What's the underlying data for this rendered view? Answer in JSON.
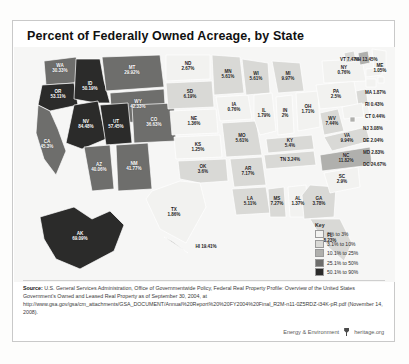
{
  "card": {
    "title": "Percent of Federally Owned Acreage, by State"
  },
  "legend": {
    "heading": "Key",
    "items": [
      {
        "label": "0% to 3%",
        "color": "#f2f2f0"
      },
      {
        "label": "3.1% to 10%",
        "color": "#d9d9d6"
      },
      {
        "label": "10.1% to 25%",
        "color": "#b0b0ad"
      },
      {
        "label": "25.1% to 50%",
        "color": "#6e6e6c"
      },
      {
        "label": "50.1% to 90%",
        "color": "#2b2b2a"
      }
    ]
  },
  "source": {
    "label": "Source:",
    "text": " U.S. General Services Administration, Office of Governmentwide Policy, Federal Real Property Profile: Overview of the United States Government's Owned and Leased Real Property as of September 30, 2004, at http://www.gsa.gov/gsa/cm_attachments/GSA_DOCUMENT/Annual%20Report%20%20FY2004%20Final_R2M-n11-0Z5RDZ-i34K-pR.pdf (November 14, 2008)."
  },
  "footer": {
    "series": "Energy & Environment",
    "brand": "heritage.org",
    "logo": "heritage-shield-icon"
  },
  "chart_data": {
    "type": "map",
    "title": "Percent of Federally Owned Acreage, by State",
    "unit": "percent",
    "legend_bins": [
      "0% to 3%",
      "3.1% to 10%",
      "10.1% to 25%",
      "25.1% to 50%",
      "50.1% to 90%"
    ],
    "bin_colors": [
      "#f2f2f0",
      "#d9d9d6",
      "#b0b0ad",
      "#6e6e6c",
      "#2b2b2a"
    ],
    "states": [
      {
        "ab": "WA",
        "value": "30.33%",
        "num": 30.33,
        "bin": 3
      },
      {
        "ab": "OR",
        "value": "53.11%",
        "num": 53.11,
        "bin": 4
      },
      {
        "ab": "ID",
        "value": "50.19%",
        "num": 50.19,
        "bin": 4
      },
      {
        "ab": "MT",
        "value": "29.92%",
        "num": 29.92,
        "bin": 3
      },
      {
        "ab": "WY",
        "value": "42.33%",
        "num": 42.33,
        "bin": 3
      },
      {
        "ab": "NV",
        "value": "84.48%",
        "num": 84.48,
        "bin": 4
      },
      {
        "ab": "UT",
        "value": "57.45%",
        "num": 57.45,
        "bin": 4
      },
      {
        "ab": "CO",
        "value": "36.63%",
        "num": 36.63,
        "bin": 3
      },
      {
        "ab": "CA",
        "value": "45.3%",
        "num": 45.3,
        "bin": 3
      },
      {
        "ab": "AZ",
        "value": "40.06%",
        "num": 40.06,
        "bin": 3
      },
      {
        "ab": "NM",
        "value": "41.77%",
        "num": 41.77,
        "bin": 3
      },
      {
        "ab": "ND",
        "value": "2.67%",
        "num": 2.67,
        "bin": 0
      },
      {
        "ab": "SD",
        "value": "6.19%",
        "num": 6.19,
        "bin": 1
      },
      {
        "ab": "NE",
        "value": "1.36%",
        "num": 1.36,
        "bin": 0
      },
      {
        "ab": "KS",
        "value": "1.25%",
        "num": 1.25,
        "bin": 0
      },
      {
        "ab": "MN",
        "value": "5.61%",
        "num": 5.61,
        "bin": 1
      },
      {
        "ab": "IA",
        "value": "0.76%",
        "num": 0.76,
        "bin": 0
      },
      {
        "ab": "MO",
        "value": "5.61%",
        "num": 5.61,
        "bin": 1
      },
      {
        "ab": "WI",
        "value": "5.61%",
        "num": 5.61,
        "bin": 1
      },
      {
        "ab": "IL",
        "value": "1.79%",
        "num": 1.79,
        "bin": 0
      },
      {
        "ab": "MI",
        "value": "9.97%",
        "num": 9.97,
        "bin": 1
      },
      {
        "ab": "IN",
        "value": "2%",
        "num": 2.0,
        "bin": 0
      },
      {
        "ab": "OH",
        "value": "1.71%",
        "num": 1.71,
        "bin": 0
      },
      {
        "ab": "KY",
        "value": "5.4%",
        "num": 5.4,
        "bin": 1
      },
      {
        "ab": "TN",
        "value": "3.24%",
        "num": 3.24,
        "bin": 1
      },
      {
        "ab": "OK",
        "value": "3.6%",
        "num": 3.6,
        "bin": 1
      },
      {
        "ab": "AR",
        "value": "7.17%",
        "num": 7.17,
        "bin": 1
      },
      {
        "ab": "TX",
        "value": "1.86%",
        "num": 1.86,
        "bin": 0
      },
      {
        "ab": "LA",
        "value": "5.11%",
        "num": 5.11,
        "bin": 1
      },
      {
        "ab": "MS",
        "value": "7.27%",
        "num": 7.27,
        "bin": 1
      },
      {
        "ab": "AL",
        "value": "1.37%",
        "num": 1.37,
        "bin": 0
      },
      {
        "ab": "GA",
        "value": "3.78%",
        "num": 3.78,
        "bin": 1
      },
      {
        "ab": "FL",
        "value": "8.23%",
        "num": 8.23,
        "bin": 1
      },
      {
        "ab": "SC",
        "value": "2.9%",
        "num": 2.9,
        "bin": 0
      },
      {
        "ab": "NC",
        "value": "11.82%",
        "num": 11.82,
        "bin": 2
      },
      {
        "ab": "VA",
        "value": "9.94%",
        "num": 9.94,
        "bin": 1
      },
      {
        "ab": "WV",
        "value": "7.44%",
        "num": 7.44,
        "bin": 1
      },
      {
        "ab": "PA",
        "value": "2.5%",
        "num": 2.5,
        "bin": 0
      },
      {
        "ab": "NY",
        "value": "0.76%",
        "num": 0.76,
        "bin": 0
      },
      {
        "ab": "VT",
        "value": "7.47%",
        "num": 7.47,
        "bin": 1
      },
      {
        "ab": "NH",
        "value": "13.45%",
        "num": 13.45,
        "bin": 2
      },
      {
        "ab": "ME",
        "value": "1.05%",
        "num": 1.05,
        "bin": 0
      },
      {
        "ab": "MA",
        "value": "1.87%",
        "num": 1.87,
        "bin": 0
      },
      {
        "ab": "RI",
        "value": "0.43%",
        "num": 0.43,
        "bin": 0
      },
      {
        "ab": "CT",
        "value": "0.44%",
        "num": 0.44,
        "bin": 0
      },
      {
        "ab": "NJ",
        "value": "3.08%",
        "num": 3.08,
        "bin": 1
      },
      {
        "ab": "DE",
        "value": "2.04%",
        "num": 2.04,
        "bin": 0
      },
      {
        "ab": "MD",
        "value": "2.83%",
        "num": 2.83,
        "bin": 0
      },
      {
        "ab": "DC",
        "value": "24.67%",
        "num": 24.67,
        "bin": 2
      },
      {
        "ab": "AK",
        "value": "69.09%",
        "num": 69.09,
        "bin": 4
      },
      {
        "ab": "HI",
        "value": "19.41%",
        "num": 19.41,
        "bin": 2
      }
    ]
  }
}
